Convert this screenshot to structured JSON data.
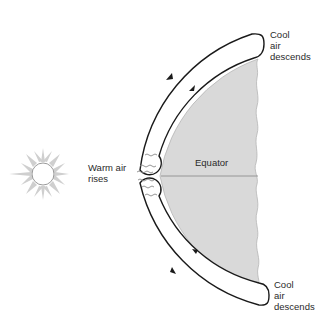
{
  "diagram": {
    "labels": {
      "cool_top": "Cool\nair\ndescends",
      "cool_bottom": "Cool\nair\ndescends",
      "warm": "Warm air\nrises",
      "equator": "Equator"
    },
    "colors": {
      "earth_fill": "#d9d9d9",
      "earth_edge": "#a8a8a8",
      "loop_stroke": "#1a1a1a",
      "sun_rays": "#c8c8c8",
      "sun_outline": "#999999",
      "equator_line": "#8f8f8f",
      "wave": "#8a8a8a"
    },
    "icons": {
      "sun": "sun-icon",
      "earth": "earth-hemisphere",
      "circulation": "convection-loop-arrows",
      "heat": "heat-wave-lines"
    }
  }
}
